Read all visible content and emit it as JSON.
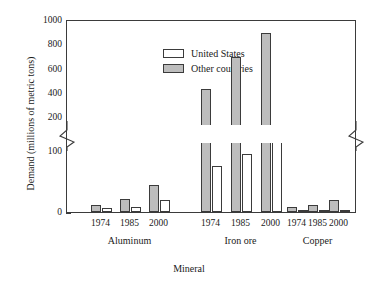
{
  "chart_data": {
    "type": "bar",
    "title": "",
    "xlabel": "Mineral",
    "ylabel": "Demand (millions of metric tons)",
    "categories": [
      "Aluminum 1974",
      "Aluminum 1985",
      "Aluminum 2000",
      "Iron ore 1974",
      "Iron ore 1985",
      "Iron ore 2000",
      "Copper 1974",
      "Copper 1985",
      "Copper 2000"
    ],
    "groups": [
      {
        "name": "Aluminum",
        "years": [
          "1974",
          "1985",
          "2000"
        ]
      },
      {
        "name": "Iron ore",
        "years": [
          "1974",
          "1985",
          "2000"
        ]
      },
      {
        "name": "Copper",
        "years": [
          "1974",
          "1985",
          "2000"
        ]
      }
    ],
    "series": [
      {
        "name": "United States",
        "color": "#ffffff",
        "values": [
          7,
          9,
          20,
          75,
          95,
          148,
          3,
          3,
          4
        ]
      },
      {
        "name": "Other countries",
        "color": "#bdbdbd",
        "values": [
          12,
          22,
          45,
          450,
          710,
          910,
          8,
          11,
          20
        ]
      }
    ],
    "legend": [
      "United States",
      "Other countries"
    ],
    "legend_position": "top-left-inside",
    "grid": false,
    "axis_break": {
      "present": true,
      "between": [
        100,
        200
      ],
      "style": "zigzag"
    },
    "yticks": [
      "0",
      "100",
      "200",
      "400",
      "600",
      "800",
      "1000"
    ],
    "ylim_lower": [
      0,
      100
    ],
    "ylim_upper": [
      200,
      1000
    ]
  },
  "axes": {
    "y_label": "Demand (millions of metric tons)",
    "x_label": "Mineral",
    "y_ticks": [
      {
        "label": "1000",
        "value": 1000
      },
      {
        "label": "800",
        "value": 800
      },
      {
        "label": "600",
        "value": 600
      },
      {
        "label": "400",
        "value": 400
      },
      {
        "label": "200",
        "value": 200
      },
      {
        "label": "100",
        "value": 100
      },
      {
        "label": "0",
        "value": 0
      }
    ]
  },
  "legend": {
    "items": [
      {
        "label": "United States",
        "swatch": "white"
      },
      {
        "label": "Other countries",
        "swatch": "gray"
      }
    ]
  },
  "x_axis": {
    "years": [
      "1974",
      "1985",
      "2000",
      "1974",
      "1985",
      "2000",
      "1974",
      "1985",
      "2000"
    ],
    "groups": [
      "Aluminum",
      "Iron ore",
      "Copper"
    ]
  },
  "colors": {
    "united_states": "#ffffff",
    "other_countries": "#bdbdbd",
    "outline": "#3b3b3b",
    "background": "#ffffff"
  }
}
